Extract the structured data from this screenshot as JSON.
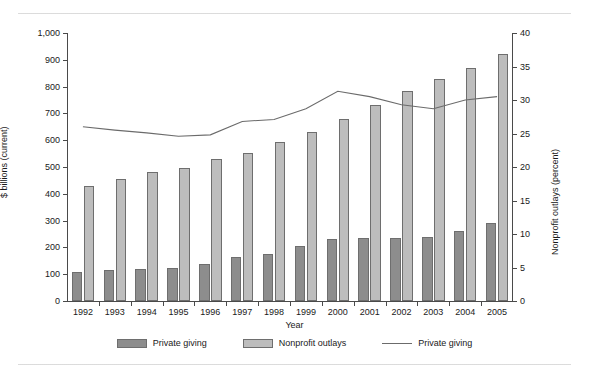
{
  "chart_data": {
    "type": "bar",
    "title": "",
    "xlabel": "Year",
    "ylabel": "$ billions (current)",
    "ylabel_right": "Nonprofit outlays (percent)",
    "categories": [
      "1992",
      "1993",
      "1994",
      "1995",
      "1996",
      "1997",
      "1998",
      "1999",
      "2000",
      "2001",
      "2002",
      "2003",
      "2004",
      "2005"
    ],
    "ylim": [
      0,
      1000
    ],
    "yticks": [
      "0",
      "100",
      "200",
      "300",
      "400",
      "500",
      "600",
      "700",
      "800",
      "900",
      "1,000"
    ],
    "ytick_values": [
      0,
      100,
      200,
      300,
      400,
      500,
      600,
      700,
      800,
      900,
      1000
    ],
    "ylim_right": [
      0,
      40
    ],
    "yticks_right": [
      "0",
      "5",
      "10",
      "15",
      "20",
      "25",
      "30",
      "35",
      "40"
    ],
    "ytick_values_right": [
      0,
      5,
      10,
      15,
      20,
      25,
      30,
      35,
      40
    ],
    "grid": false,
    "legend_position": "bottom",
    "series": [
      {
        "name": "Private giving",
        "kind": "bar",
        "axis": "left",
        "color": "#8d8d8d",
        "values": [
          110,
          117,
          121,
          124,
          139,
          164,
          177,
          207,
          232,
          235,
          235,
          240,
          261,
          290
        ]
      },
      {
        "name": "Nonprofit outlays",
        "kind": "bar",
        "axis": "left",
        "color": "#bdbdbd",
        "values": [
          430,
          455,
          480,
          498,
          530,
          553,
          595,
          630,
          680,
          730,
          785,
          830,
          870,
          920
        ]
      },
      {
        "name": "Private giving",
        "kind": "line",
        "axis": "right",
        "color": "#6b6b6b",
        "values": [
          26.0,
          25.5,
          25.1,
          24.6,
          24.8,
          26.8,
          27.1,
          28.7,
          31.3,
          30.5,
          29.3,
          28.7,
          30.0,
          30.5
        ]
      }
    ]
  },
  "legend": {
    "items": [
      {
        "label": "Private giving",
        "type": "swatch-dark"
      },
      {
        "label": "Nonprofit outlays",
        "type": "swatch-light"
      },
      {
        "label": "Private giving",
        "type": "swatch-line"
      }
    ]
  },
  "colors": {
    "bar_dark": "#8d8d8d",
    "bar_light": "#bdbdbd",
    "line": "#6b6b6b",
    "axis": "#4a4a4a",
    "rule": "#cfcfcf",
    "background": "#ffffff"
  }
}
